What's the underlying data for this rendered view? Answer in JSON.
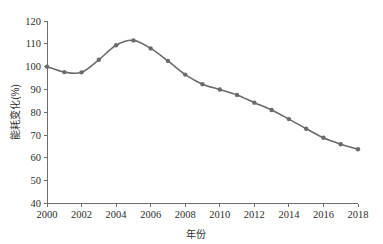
{
  "chart_data": {
    "type": "line",
    "title": "",
    "subtitle": "",
    "xlabel": "年份",
    "ylabel": "能耗变化(%)",
    "xlim": [
      2000,
      2018
    ],
    "ylim": [
      40,
      120
    ],
    "ytick_step": 10,
    "xtick_step": 2,
    "grid": false,
    "legend": null,
    "legend_position": "none",
    "x_tick_labels": [
      "2000",
      "2002",
      "2004",
      "2006",
      "2008",
      "2010",
      "2012",
      "2014",
      "2016",
      "2018"
    ],
    "y_tick_labels": [
      "40",
      "50",
      "60",
      "70",
      "80",
      "90",
      "100",
      "110",
      "120"
    ],
    "x": [
      2000,
      2001,
      2002,
      2003,
      2004,
      2005,
      2006,
      2007,
      2008,
      2009,
      2010,
      2011,
      2012,
      2013,
      2014,
      2015,
      2016,
      2017,
      2018
    ],
    "series": [
      {
        "name": "能耗变化",
        "color": "#6b6b6b",
        "marker": "circle",
        "values": [
          100.0,
          97.6,
          97.5,
          103.0,
          109.4,
          111.5,
          108.0,
          102.5,
          96.5,
          92.3,
          90.0,
          87.6,
          84.2,
          81.0,
          77.0,
          72.8,
          68.8,
          66.0,
          63.8
        ]
      }
    ]
  },
  "style": {
    "line_color": "#6b6b6b",
    "marker_color": "#6b6b6b",
    "axis_color": "#6e6e6e",
    "text_color": "#2e2e2e",
    "background": "#ffffff",
    "line_width": 1.6,
    "marker_radius": 2.2
  }
}
